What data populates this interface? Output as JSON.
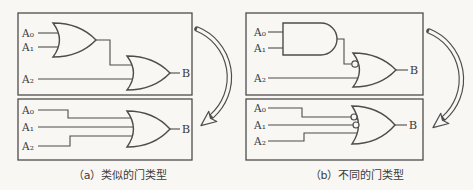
{
  "figure": {
    "colors": {
      "background": "#f8f7f4",
      "line": "#4d4d4d",
      "text": "#3b3b3b"
    },
    "panels": [
      {
        "caption": "（a）类似的门类型",
        "circuits": [
          {
            "inputs": [
              "A₀",
              "A₁",
              "A₂"
            ],
            "output": "B",
            "gates": [
              "2-input OR",
              "2-input OR"
            ]
          },
          {
            "inputs": [
              "A₀",
              "A₁",
              "A₂"
            ],
            "output": "B",
            "gates": [
              "3-input OR"
            ]
          }
        ]
      },
      {
        "caption": "（b）不同的门类型",
        "circuits": [
          {
            "inputs": [
              "A₀",
              "A₁",
              "A₂"
            ],
            "output": "B",
            "gates": [
              "2-input AND",
              "2-input OR with inverted top input"
            ]
          },
          {
            "inputs": [
              "A₀",
              "A₁",
              "A₂"
            ],
            "output": "B",
            "gates": [
              "3-input OR with two inverted inputs"
            ]
          }
        ]
      }
    ]
  }
}
